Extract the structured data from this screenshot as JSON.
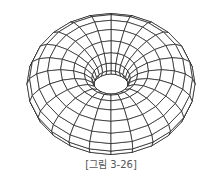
{
  "figure": {
    "type": "wireframe-torus",
    "caption": "[그림 3-26]",
    "stroke_color": "#1a1a1a",
    "background": "#ffffff",
    "geometry": {
      "major_segments": 24,
      "minor_segments": 16,
      "center_x": 111,
      "center_y": 84,
      "major_radius": 48,
      "minor_radius": 32,
      "tilt_deg": 62
    }
  }
}
